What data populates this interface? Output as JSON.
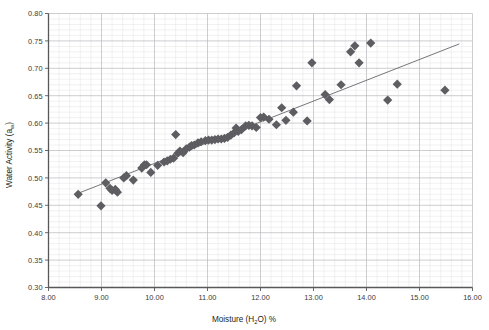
{
  "chart_data": {
    "type": "scatter",
    "title": "",
    "xlabel": "Moisture (H2O) %",
    "xlabel_parts": {
      "pre": "Moisture (H",
      "sub": "2",
      "post": "O) %"
    },
    "ylabel": "Water Activity (aw)",
    "ylabel_parts": {
      "pre": "Water Activity (a",
      "sub": "w",
      "post": ")"
    },
    "xlim": [
      8.0,
      16.0
    ],
    "ylim": [
      0.3,
      0.8
    ],
    "x_major_step": 1.0,
    "y_major_step": 0.05,
    "x_minor_step": 0.2,
    "y_minor_step": 0.01,
    "grid": "major-and-minor",
    "legend": "none",
    "marker": "diamond",
    "marker_color": "#5d5d62",
    "marker_size": 4.6,
    "trendline": {
      "visible": true,
      "color": "#6f6f74",
      "x_start": 8.55,
      "y_start": 0.4715,
      "x_end": 15.75,
      "y_end": 0.7445
    },
    "xticks": [
      "8.00",
      "9.00",
      "10.00",
      "11.00",
      "12.00",
      "13.00",
      "14.00",
      "15.00",
      "16.00"
    ],
    "xtick_values": [
      8,
      9,
      10,
      11,
      12,
      13,
      14,
      15,
      16
    ],
    "yticks": [
      "0.30",
      "0.35",
      "0.40",
      "0.45",
      "0.50",
      "0.55",
      "0.60",
      "0.65",
      "0.70",
      "0.75",
      "0.80"
    ],
    "ytick_values": [
      0.3,
      0.35,
      0.4,
      0.45,
      0.5,
      0.55,
      0.6,
      0.65,
      0.7,
      0.75,
      0.8
    ],
    "points": [
      [
        8.56,
        0.47
      ],
      [
        8.99,
        0.449
      ],
      [
        9.08,
        0.491
      ],
      [
        9.16,
        0.481
      ],
      [
        9.2,
        0.477
      ],
      [
        9.26,
        0.479
      ],
      [
        9.3,
        0.474
      ],
      [
        9.42,
        0.5
      ],
      [
        9.47,
        0.504
      ],
      [
        9.6,
        0.496
      ],
      [
        9.76,
        0.518
      ],
      [
        9.81,
        0.524
      ],
      [
        9.85,
        0.524
      ],
      [
        9.93,
        0.51
      ],
      [
        10.06,
        0.523
      ],
      [
        10.18,
        0.529
      ],
      [
        10.24,
        0.531
      ],
      [
        10.3,
        0.534
      ],
      [
        10.36,
        0.536
      ],
      [
        10.4,
        0.579
      ],
      [
        10.44,
        0.545
      ],
      [
        10.48,
        0.549
      ],
      [
        10.54,
        0.546
      ],
      [
        10.6,
        0.553
      ],
      [
        10.66,
        0.556
      ],
      [
        10.7,
        0.559
      ],
      [
        10.75,
        0.56
      ],
      [
        10.82,
        0.564
      ],
      [
        10.88,
        0.566
      ],
      [
        10.96,
        0.568
      ],
      [
        11.02,
        0.569
      ],
      [
        11.08,
        0.569
      ],
      [
        11.14,
        0.57
      ],
      [
        11.2,
        0.571
      ],
      [
        11.26,
        0.571
      ],
      [
        11.32,
        0.572
      ],
      [
        11.38,
        0.574
      ],
      [
        11.44,
        0.578
      ],
      [
        11.5,
        0.582
      ],
      [
        11.54,
        0.591
      ],
      [
        11.58,
        0.585
      ],
      [
        11.64,
        0.588
      ],
      [
        11.72,
        0.595
      ],
      [
        11.78,
        0.596
      ],
      [
        11.84,
        0.595
      ],
      [
        11.92,
        0.592
      ],
      [
        12.0,
        0.61
      ],
      [
        12.06,
        0.611
      ],
      [
        12.16,
        0.607
      ],
      [
        12.3,
        0.597
      ],
      [
        12.4,
        0.628
      ],
      [
        12.48,
        0.605
      ],
      [
        12.62,
        0.62
      ],
      [
        12.68,
        0.668
      ],
      [
        12.88,
        0.604
      ],
      [
        12.97,
        0.71
      ],
      [
        13.22,
        0.652
      ],
      [
        13.3,
        0.643
      ],
      [
        13.52,
        0.67
      ],
      [
        13.7,
        0.73
      ],
      [
        13.78,
        0.741
      ],
      [
        13.86,
        0.71
      ],
      [
        14.08,
        0.746
      ],
      [
        14.4,
        0.642
      ],
      [
        14.58,
        0.671
      ],
      [
        15.48,
        0.66
      ]
    ]
  }
}
